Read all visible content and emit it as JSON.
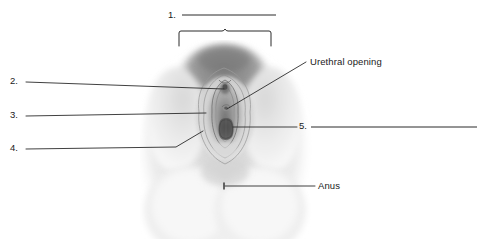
{
  "figure": {
    "kind": "anatomical-illustration",
    "style": "grayscale halftone drawing",
    "background_color": "#ffffff",
    "ink_color": "#2b2b2b"
  },
  "numbered_blanks": [
    {
      "id": "1",
      "number_text": "1.",
      "answer": "",
      "position": "top-center",
      "points_to": "mons pubis (bracketed region)"
    },
    {
      "id": "2",
      "number_text": "2.",
      "answer": "",
      "position": "left",
      "points_to": "clitoris"
    },
    {
      "id": "3",
      "number_text": "3.",
      "answer": "",
      "position": "left",
      "points_to": "labium minus"
    },
    {
      "id": "4",
      "number_text": "4.",
      "answer": "",
      "position": "left",
      "points_to": "labium majus"
    },
    {
      "id": "5",
      "number_text": "5.",
      "answer": "",
      "position": "right",
      "points_to": "vaginal opening"
    }
  ],
  "callouts": [
    {
      "id": "urethral-opening",
      "label": "Urethral opening"
    },
    {
      "id": "anus",
      "label": "Anus"
    }
  ],
  "bracket": {
    "name": "top-bracket",
    "描述": "squared bracket with centre notch spanning the mons pubis"
  }
}
